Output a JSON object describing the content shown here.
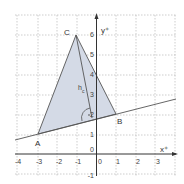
{
  "diagram": {
    "type": "coordinate-geometry",
    "axes": {
      "x_label": "x⁺",
      "y_label": "y⁺",
      "x_ticks": [
        "-4",
        "-3",
        "-2",
        "-1",
        "0",
        "1",
        "2",
        "3"
      ],
      "y_ticks": [
        "-1",
        "0",
        "1",
        "2",
        "3",
        "4",
        "5",
        "6"
      ],
      "xlim": [
        -4,
        3.8
      ],
      "ylim": [
        -1,
        6.5
      ]
    },
    "points": {
      "A": {
        "label": "A",
        "x": -3,
        "y": 1
      },
      "B": {
        "label": "B",
        "x": 1,
        "y": 2
      },
      "C": {
        "label": "C",
        "x": -1,
        "y": 6
      }
    },
    "altitude_label": "h",
    "altitude_subscript": "c",
    "angle_marker": "right-angle",
    "colors": {
      "triangle_fill": "#d4dae6",
      "lines": "#555555",
      "grid": "#b8b8b8"
    }
  }
}
